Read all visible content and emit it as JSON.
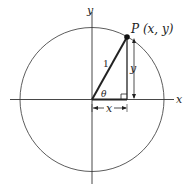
{
  "diagram": {
    "labels": {
      "point": "P (x, y)",
      "x_axis": "x",
      "y_axis": "y",
      "hypotenuse": "1",
      "angle": "θ",
      "horizontal_leg": "x",
      "vertical_leg": "y"
    },
    "colors": {
      "stroke": "#222222",
      "background": "#ffffff"
    }
  }
}
